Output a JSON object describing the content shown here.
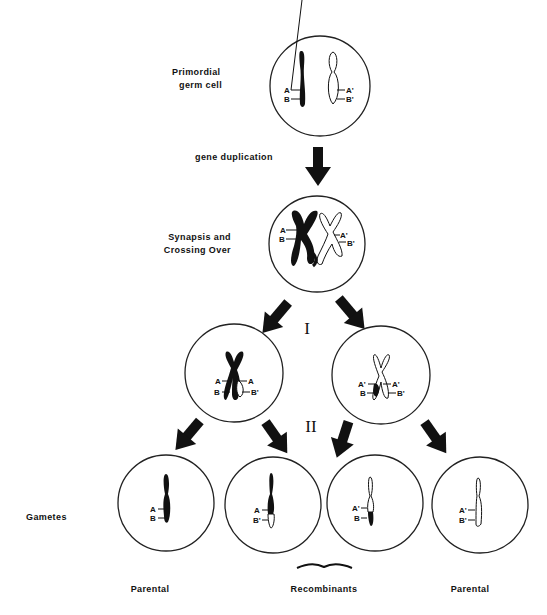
{
  "labels": {
    "primordial": [
      "Primordial",
      "germ cell"
    ],
    "gene_duplication": "gene duplication",
    "synapsis": [
      "Synapsis and",
      "Crossing Over"
    ],
    "division_1": "I",
    "division_2": "II",
    "gametes": "Gametes",
    "parental_left": "Parental",
    "recombinants": "Recombinants",
    "parental_right": "Parental"
  },
  "alleles": {
    "A": "A",
    "B": "B",
    "A_prime": "A'",
    "B_prime": "B'"
  },
  "cells": [
    {
      "id": "primordial-germ-cell",
      "left_chromosome": [
        "A",
        "B"
      ],
      "right_chromosome": [
        "A'",
        "B'"
      ]
    },
    {
      "id": "synapsis-cell",
      "left_chromosome": [
        "A",
        "B"
      ],
      "right_chromosome": [
        "A'",
        "B'"
      ]
    },
    {
      "id": "meiosis-I-left-cell",
      "chromatids": [
        "A-B",
        "A-B'"
      ]
    },
    {
      "id": "meiosis-I-right-cell",
      "chromatids": [
        "A'-B",
        "A'-B'"
      ]
    },
    {
      "id": "gamete-1",
      "chromosome": [
        "A",
        "B"
      ],
      "type": "Parental"
    },
    {
      "id": "gamete-2",
      "chromosome": [
        "A",
        "B'"
      ],
      "type": "Recombinant"
    },
    {
      "id": "gamete-3",
      "chromosome": [
        "A'",
        "B"
      ],
      "type": "Recombinant"
    },
    {
      "id": "gamete-4",
      "chromosome": [
        "A'",
        "B'"
      ],
      "type": "Parental"
    }
  ]
}
